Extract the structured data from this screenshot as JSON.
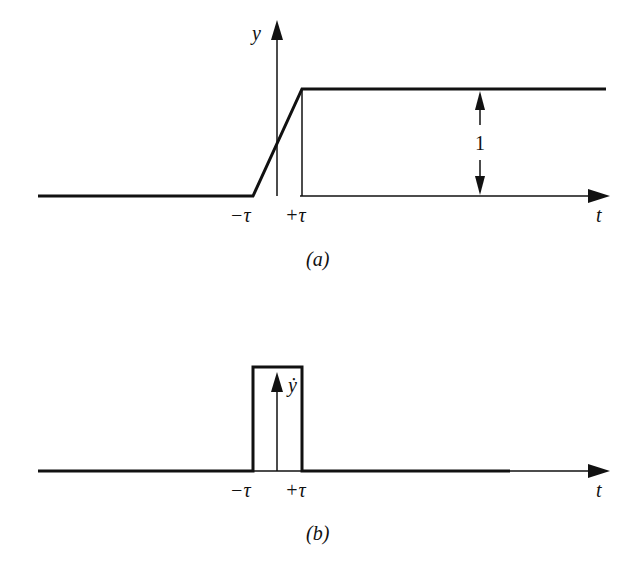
{
  "figure_a": {
    "y_axis_label": "y",
    "t_axis_label": "t",
    "tick_minus": "−τ",
    "tick_plus": "+τ",
    "height_label": "1",
    "caption": "(a)"
  },
  "figure_b": {
    "y_axis_label": "ẏ",
    "t_axis_label": "t",
    "tick_minus": "−τ",
    "tick_plus": "+τ",
    "caption": "(b)"
  },
  "colors": {
    "ink": "#111111",
    "background": "#ffffff"
  }
}
